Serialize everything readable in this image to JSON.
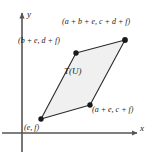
{
  "figure": {
    "background_color": "#ffffff",
    "stroke_color": "#1a1a1a",
    "fill_color": "#f0f0f0",
    "axis_color": "#555555"
  },
  "axes": {
    "x_label": "x",
    "y_label": "y",
    "origin": {
      "x": 22,
      "y": 133
    },
    "x_arrow_tip": {
      "x": 139,
      "y": 133
    },
    "y_arrow_tip": {
      "x": 22,
      "y": 11
    }
  },
  "region": {
    "label": "T(U)"
  },
  "vertices": [
    {
      "name": "bottom-left",
      "label": "(e, f)",
      "x": 41,
      "y": 119
    },
    {
      "name": "bottom-right",
      "label": "(a + e, c + f)",
      "x": 90,
      "y": 105
    },
    {
      "name": "top-right",
      "label": "(a + b + e, c + d + f)",
      "x": 125,
      "y": 40
    },
    {
      "name": "top-left",
      "label": "(b + e, d + f)",
      "x": 76,
      "y": 53
    }
  ],
  "polygon_points": "41,119 90,105 125,40 76,53"
}
